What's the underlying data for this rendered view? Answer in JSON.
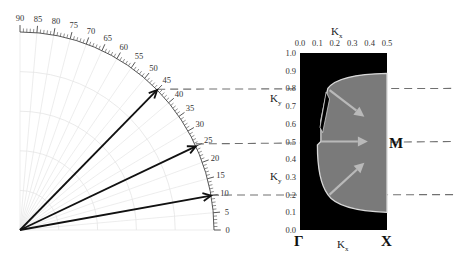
{
  "figure": {
    "polar": {
      "angle_min_deg": 0,
      "angle_max_deg": 90,
      "major_label_step_deg": 5,
      "minor_tick_step_deg": 1,
      "angle_labels": [
        "0",
        "5",
        "10",
        "15",
        "20",
        "25",
        "30",
        "35",
        "40",
        "45",
        "50",
        "55",
        "60",
        "65",
        "70",
        "75",
        "80",
        "85",
        "90"
      ],
      "arrows_deg": [
        45,
        25,
        10
      ]
    },
    "panel": {
      "kx_range": [
        0.0,
        0.5
      ],
      "ky_range": [
        0.0,
        1.0
      ],
      "kx_tick_labels": [
        "0.0",
        "0.1",
        "0.2",
        "0.3",
        "0.4",
        "0.5"
      ],
      "ky_tick_labels": [
        "0.0",
        "0.1",
        "0.2",
        "0.3",
        "0.4",
        "0.5",
        "0.6",
        "0.7",
        "0.8",
        "0.9",
        "1.0"
      ],
      "top_axis_label": {
        "main": "K",
        "sub": "x"
      },
      "bottom_axis_label": {
        "main": "K",
        "sub": "x"
      },
      "left_axis_labels": [
        {
          "main": "K",
          "sub": "y",
          "at_ky": 0.75
        },
        {
          "main": "K",
          "sub": "y",
          "at_ky": 0.3
        }
      ],
      "corner_labels": {
        "gamma": "Γ",
        "x_point": "X",
        "m_point": "M"
      },
      "dashed_ky_levels": [
        0.8,
        0.5,
        0.2
      ],
      "colors": {
        "background": "#000000",
        "region": "#7a7a7a",
        "region_edge": "#d8d8d8",
        "arrow": "#b9b9b9",
        "dash": "#707070"
      }
    }
  }
}
